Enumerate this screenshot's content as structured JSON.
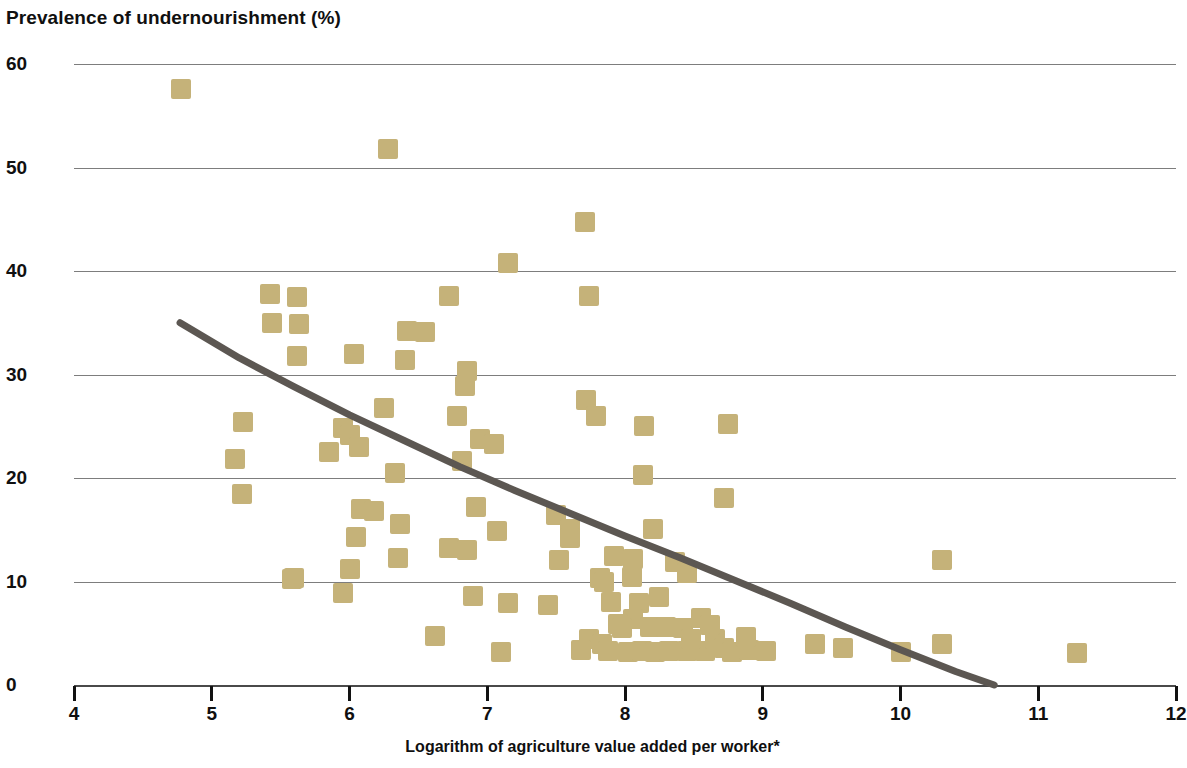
{
  "chart_data": {
    "type": "scatter",
    "title": "Prevalence of undernourishment (%)",
    "xlabel": "Logarithm of agriculture value added per worker*",
    "ylabel": "Prevalence of undernourishment (%)",
    "xlim": [
      4,
      12
    ],
    "ylim": [
      0,
      60
    ],
    "xticks": [
      4,
      5,
      6,
      7,
      8,
      9,
      10,
      11,
      12
    ],
    "yticks": [
      0,
      10,
      20,
      30,
      40,
      50,
      60
    ],
    "xtick_labels": [
      "4",
      "5",
      "6",
      "7",
      "8",
      "9",
      "10",
      "11",
      "12"
    ],
    "ytick_labels": [
      "0",
      "10",
      "20",
      "30",
      "40",
      "50",
      "60"
    ],
    "grid": "horizontal",
    "legend": "none",
    "marker_color": "#c5b279",
    "marker_shape": "square",
    "trendline": {
      "label": "fitted trend",
      "color": "#5c5752",
      "width_px": 7,
      "type": "curve",
      "points": [
        [
          4.77,
          35.0
        ],
        [
          5.2,
          31.6
        ],
        [
          5.6,
          28.8
        ],
        [
          6.0,
          26.1
        ],
        [
          6.4,
          23.6
        ],
        [
          6.8,
          21.1
        ],
        [
          7.2,
          18.8
        ],
        [
          7.6,
          16.6
        ],
        [
          8.0,
          14.4
        ],
        [
          8.4,
          12.3
        ],
        [
          8.8,
          10.1
        ],
        [
          9.2,
          7.9
        ],
        [
          9.6,
          5.6
        ],
        [
          10.0,
          3.4
        ],
        [
          10.4,
          1.3
        ],
        [
          10.68,
          0.0
        ]
      ]
    },
    "points": [
      [
        4.78,
        57.6
      ],
      [
        6.28,
        51.8
      ],
      [
        7.71,
        44.7
      ],
      [
        7.15,
        40.8
      ],
      [
        5.42,
        37.8
      ],
      [
        5.62,
        37.5
      ],
      [
        6.72,
        37.6
      ],
      [
        7.74,
        37.6
      ],
      [
        5.44,
        35.0
      ],
      [
        5.63,
        34.9
      ],
      [
        6.42,
        34.2
      ],
      [
        6.55,
        34.1
      ],
      [
        5.62,
        31.8
      ],
      [
        6.03,
        32.0
      ],
      [
        6.4,
        31.4
      ],
      [
        6.85,
        30.3
      ],
      [
        6.84,
        28.9
      ],
      [
        6.25,
        26.8
      ],
      [
        7.72,
        27.5
      ],
      [
        6.78,
        26.0
      ],
      [
        7.79,
        26.0
      ],
      [
        5.23,
        25.4
      ],
      [
        8.14,
        25.0
      ],
      [
        8.75,
        25.2
      ],
      [
        5.85,
        22.5
      ],
      [
        5.95,
        24.8
      ],
      [
        6.0,
        24.2
      ],
      [
        6.07,
        23.0
      ],
      [
        6.95,
        23.8
      ],
      [
        7.05,
        23.3
      ],
      [
        5.17,
        21.8
      ],
      [
        6.33,
        20.5
      ],
      [
        6.82,
        21.6
      ],
      [
        8.13,
        20.3
      ],
      [
        5.22,
        18.5
      ],
      [
        6.92,
        17.2
      ],
      [
        8.72,
        18.1
      ],
      [
        6.08,
        17.0
      ],
      [
        6.18,
        16.8
      ],
      [
        7.5,
        16.4
      ],
      [
        6.37,
        15.6
      ],
      [
        7.6,
        15.1
      ],
      [
        8.2,
        15.1
      ],
      [
        6.05,
        14.3
      ],
      [
        7.6,
        14.2
      ],
      [
        7.07,
        14.9
      ],
      [
        6.72,
        13.2
      ],
      [
        6.85,
        13.0
      ],
      [
        7.52,
        12.1
      ],
      [
        6.35,
        12.3
      ],
      [
        7.92,
        12.5
      ],
      [
        8.36,
        11.9
      ],
      [
        8.06,
        12.2
      ],
      [
        10.3,
        12.1
      ],
      [
        5.58,
        10.2
      ],
      [
        5.6,
        10.3
      ],
      [
        6.0,
        11.2
      ],
      [
        8.45,
        10.8
      ],
      [
        7.82,
        10.3
      ],
      [
        7.85,
        10.0
      ],
      [
        8.05,
        10.4
      ],
      [
        5.95,
        8.9
      ],
      [
        6.9,
        8.6
      ],
      [
        7.15,
        7.9
      ],
      [
        7.44,
        7.7
      ],
      [
        7.9,
        8.0
      ],
      [
        8.1,
        7.9
      ],
      [
        8.25,
        8.5
      ],
      [
        8.06,
        6.4
      ],
      [
        7.95,
        5.9
      ],
      [
        7.98,
        5.5
      ],
      [
        8.18,
        5.6
      ],
      [
        8.3,
        5.6
      ],
      [
        8.42,
        5.5
      ],
      [
        6.62,
        4.7
      ],
      [
        7.74,
        4.4
      ],
      [
        7.83,
        4.0
      ],
      [
        7.88,
        3.3
      ],
      [
        8.02,
        3.2
      ],
      [
        8.12,
        3.3
      ],
      [
        8.22,
        3.2
      ],
      [
        8.32,
        3.3
      ],
      [
        8.45,
        3.3
      ],
      [
        8.58,
        3.3
      ],
      [
        8.65,
        4.4
      ],
      [
        8.72,
        3.6
      ],
      [
        8.78,
        3.2
      ],
      [
        8.9,
        3.4
      ],
      [
        9.02,
        3.3
      ],
      [
        7.1,
        3.2
      ],
      [
        9.38,
        4.0
      ],
      [
        9.58,
        3.6
      ],
      [
        10.0,
        3.2
      ],
      [
        10.3,
        4.0
      ],
      [
        11.28,
        3.1
      ],
      [
        8.55,
        6.5
      ],
      [
        8.62,
        5.8
      ],
      [
        7.68,
        3.4
      ],
      [
        8.88,
        4.6
      ],
      [
        8.48,
        4.4
      ]
    ]
  }
}
